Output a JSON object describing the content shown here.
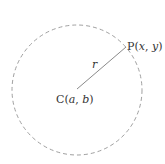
{
  "diagram": {
    "circle": {
      "cx": 77,
      "cy": 90,
      "r": 65,
      "stroke": "#a0a0a0",
      "style": "dashed"
    },
    "radius_line": {
      "x1": 77,
      "y1": 89,
      "x2": 126,
      "y2": 47,
      "stroke": "#8a8a8a"
    },
    "center_label": {
      "prefix": "C",
      "open": "(",
      "a": "a",
      "sep": ", ",
      "b": "b",
      "close": ")"
    },
    "point_label": {
      "prefix": "P",
      "open": "(",
      "x": "x",
      "sep": ", ",
      "y": "y",
      "close": ")"
    },
    "radius_label": "r"
  }
}
